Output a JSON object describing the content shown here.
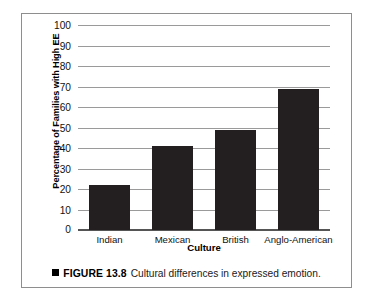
{
  "figure": {
    "caption_bullet": "square-bullet",
    "caption_label": "FIGURE 13.8",
    "caption_text": "Cultural differences in expressed emotion."
  },
  "chart_data": {
    "type": "bar",
    "title": "",
    "categories": [
      "Indian",
      "Mexican",
      "British",
      "Anglo-American"
    ],
    "values": [
      22,
      41,
      49,
      69
    ],
    "xlabel": "Culture",
    "ylabel": "Percentage of Families with High EE",
    "ylim": [
      0,
      100
    ],
    "yticks": [
      0,
      10,
      20,
      30,
      40,
      50,
      60,
      70,
      80,
      90,
      100
    ],
    "ytick_labels": [
      "0",
      "10",
      "20",
      "30",
      "40",
      "50",
      "60",
      "70",
      "80",
      "90",
      "100"
    ],
    "grid": true,
    "legend": "none",
    "bar_color": "#231f20",
    "gridline_color": "#9a9a9a"
  }
}
